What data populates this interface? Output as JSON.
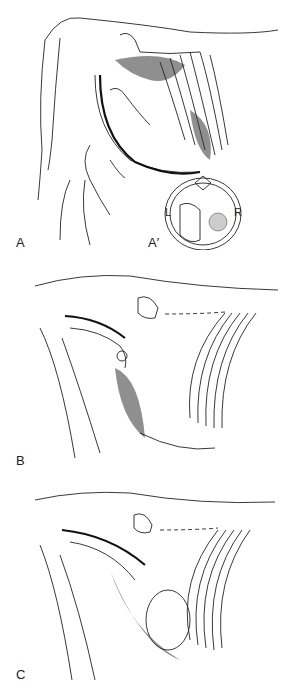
{
  "figure": {
    "panels": [
      {
        "id": "A",
        "label": "A",
        "description": "Left lateral view of cow abdomen with ribs, spine, rumen and uterus"
      },
      {
        "id": "A_prime",
        "label": "A′",
        "description": "Cross-section of abdomen",
        "side_labels": {
          "left": "L",
          "right": "R"
        }
      },
      {
        "id": "B",
        "label": "B",
        "description": "Lateral view, hindquarter with ribs and intestinal coil"
      },
      {
        "id": "C",
        "label": "C",
        "description": "Lateral view with displaced organ and shaded viscera"
      }
    ]
  },
  "colors": {
    "line": "#222222",
    "background": "#ffffff",
    "shading": "#333333"
  }
}
